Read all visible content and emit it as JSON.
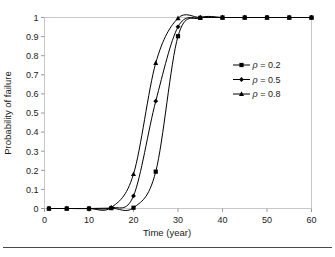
{
  "chart_data": {
    "type": "line",
    "title": "",
    "xlabel": "Time (year)",
    "ylabel": "Probability of failure",
    "xlim": [
      0,
      60
    ],
    "ylim": [
      0,
      1
    ],
    "xticks": [
      0,
      10,
      20,
      30,
      40,
      50,
      60
    ],
    "xtick_labels": [
      "0",
      "10",
      "20",
      "30",
      "40",
      "50",
      "60"
    ],
    "yticks": [
      0,
      0.1,
      0.2,
      0.3,
      0.4,
      0.5,
      0.6,
      0.7,
      0.8,
      0.9,
      1
    ],
    "ytick_labels": [
      "0",
      "0.1",
      "0.2",
      "0.3",
      "0.4",
      "0.5",
      "0.6",
      "0.7",
      "0.8",
      "0.9",
      "1"
    ],
    "grid": false,
    "legend_position": "right-upper",
    "series": [
      {
        "name": "rho = 0.2",
        "legend_label": "ρ = 0.2",
        "marker": "square",
        "x": [
          1,
          5,
          10,
          15,
          20,
          25,
          30,
          35,
          40,
          45,
          50,
          55,
          60
        ],
        "values": [
          0,
          0,
          0,
          0.002,
          0.004,
          0.193,
          0.902,
          0.998,
          1,
          1,
          1,
          1,
          1
        ]
      },
      {
        "name": "rho = 0.5",
        "legend_label": "ρ = 0.5",
        "marker": "diamond",
        "x": [
          1,
          5,
          10,
          15,
          20,
          25,
          30,
          35,
          40,
          45,
          50,
          55,
          60
        ],
        "values": [
          0,
          0,
          0,
          0.003,
          0.066,
          0.562,
          0.951,
          0.999,
          1,
          1,
          1,
          1,
          1
        ]
      },
      {
        "name": "rho = 0.8",
        "legend_label": "ρ = 0.8",
        "marker": "triangle",
        "x": [
          1,
          5,
          10,
          15,
          20,
          25,
          30,
          35,
          40,
          45,
          50,
          55,
          60
        ],
        "values": [
          0,
          0,
          0,
          0.005,
          0.18,
          0.762,
          0.996,
          1,
          1,
          1,
          1,
          1,
          1
        ]
      }
    ]
  },
  "legend": {
    "entries": [
      {
        "label": "ρ = 0.2",
        "marker": "square"
      },
      {
        "label": "ρ = 0.5",
        "marker": "diamond"
      },
      {
        "label": "ρ = 0.8",
        "marker": "triangle"
      }
    ]
  },
  "colors": {
    "series": "#000000",
    "frame": "#c9c9c9",
    "text": "#1a1a1a",
    "rule": "#4a4a4a"
  }
}
